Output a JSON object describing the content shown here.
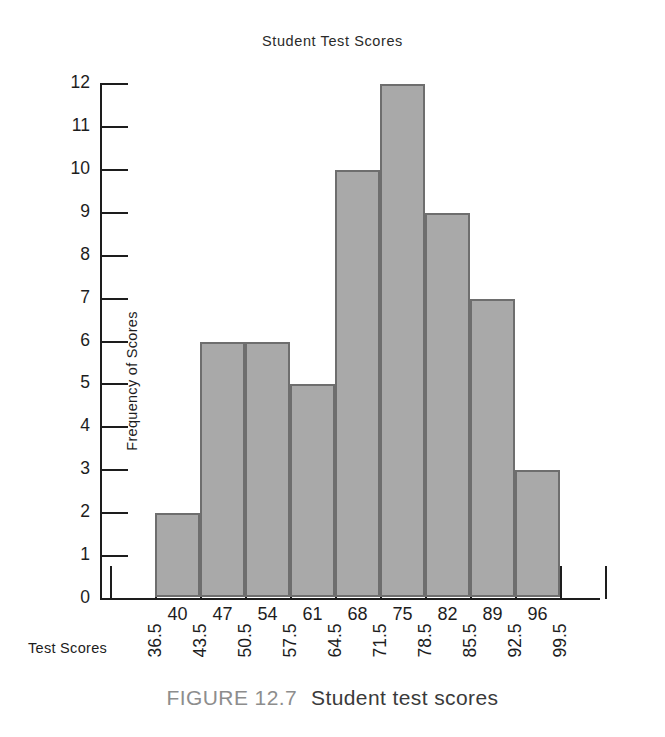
{
  "chart_data": {
    "type": "bar",
    "title": "Student Test Scores",
    "xlabel": "Test Scores",
    "ylabel": "Frequency of Scores",
    "categories": [
      "40",
      "47",
      "54",
      "61",
      "68",
      "75",
      "82",
      "89",
      "96"
    ],
    "values": [
      2,
      6,
      6,
      5,
      10,
      12,
      9,
      7,
      3
    ],
    "class_boundaries": [
      "36.5",
      "43.5",
      "50.5",
      "57.5",
      "64.5",
      "71.5",
      "78.5",
      "85.5",
      "92.5",
      "99.5"
    ],
    "ylim": [
      0,
      12
    ],
    "yticks": [
      "12",
      "11",
      "10",
      "9",
      "8",
      "7",
      "6",
      "5",
      "4",
      "3",
      "2",
      "1",
      "0"
    ],
    "grid": false,
    "legend": null,
    "bar_fill_color": "#a9a9a9",
    "bar_edge_color": "#6e6e6e",
    "axis_color": "#1d1d1d"
  },
  "caption": {
    "figure_number": "FIGURE 12.7",
    "figure_text": "Student test scores"
  }
}
